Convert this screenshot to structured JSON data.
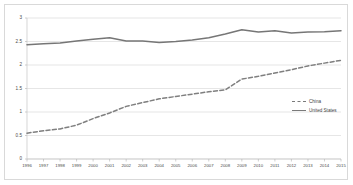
{
  "chart_data": {
    "type": "line",
    "title": "",
    "xlabel": "",
    "ylabel": "",
    "ylim": [
      0,
      3
    ],
    "ytick_values": [
      0,
      0.5,
      1,
      1.5,
      2,
      2.5,
      3
    ],
    "ytick_labels": [
      "0",
      "0.5",
      "1",
      "1.5",
      "2",
      "2.5",
      "3"
    ],
    "grid": true,
    "grid_axis": "y",
    "legend_position": "right-middle",
    "categories": [
      "1996",
      "1997",
      "1998",
      "1999",
      "2000",
      "2001",
      "2002",
      "2003",
      "2004",
      "2005",
      "2006",
      "2007",
      "2008",
      "2009",
      "2010",
      "2011",
      "2012",
      "2013",
      "2014",
      "2015"
    ],
    "series": [
      {
        "name": "China",
        "style": "dashed",
        "color": "#7f7f7f",
        "values": [
          0.55,
          0.6,
          0.64,
          0.72,
          0.86,
          0.98,
          1.12,
          1.2,
          1.28,
          1.33,
          1.38,
          1.43,
          1.47,
          1.7,
          1.76,
          1.83,
          1.9,
          1.98,
          2.04,
          2.1
        ]
      },
      {
        "name": "United States",
        "style": "solid",
        "color": "#767676",
        "values": [
          2.43,
          2.45,
          2.47,
          2.51,
          2.55,
          2.58,
          2.51,
          2.51,
          2.48,
          2.5,
          2.53,
          2.58,
          2.66,
          2.75,
          2.7,
          2.73,
          2.68,
          2.7,
          2.71,
          2.73
        ]
      }
    ]
  },
  "legend": {
    "entries": [
      {
        "label": "China",
        "style": "dashed"
      },
      {
        "label": "United States",
        "style": "solid"
      }
    ]
  }
}
